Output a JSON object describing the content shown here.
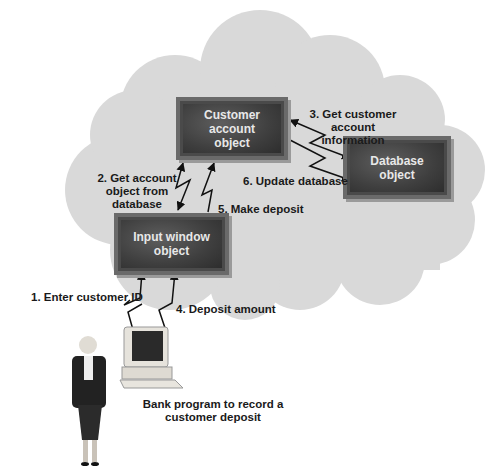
{
  "diagram": {
    "objects": {
      "customer_account": {
        "line1": "Customer account",
        "line2": "object"
      },
      "database": {
        "line1": "Database",
        "line2": "object"
      },
      "input_window": {
        "line1": "Input window",
        "line2": "object"
      }
    },
    "steps": {
      "step1": {
        "line1": "1. Enter customer ID"
      },
      "step2": {
        "line1": "2. Get account",
        "line2": "object from",
        "line3": "database"
      },
      "step3": {
        "line1": "3. Get customer account",
        "line2": "information"
      },
      "step4": {
        "line1": "4. Deposit amount"
      },
      "step5": {
        "line1": "5. Make deposit"
      },
      "step6": {
        "line1": "6. Update database"
      }
    },
    "caption": {
      "line1": "Bank program to record a",
      "line2": "customer deposit"
    },
    "colors": {
      "cloud": "#d9d9d9",
      "box": "#3f3f3f",
      "box_border": "#6a6a6a",
      "text": "#1a1a1a"
    }
  }
}
